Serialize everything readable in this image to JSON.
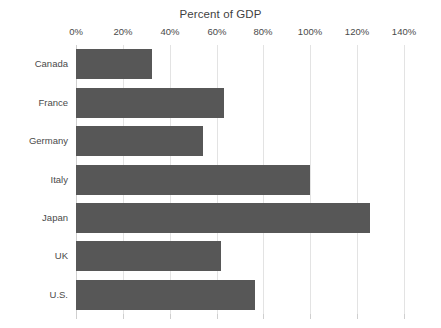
{
  "chart_data": {
    "type": "bar",
    "orientation": "horizontal",
    "title": "Percent of GDP",
    "xlabel": "",
    "ylabel": "",
    "categories": [
      "Canada",
      "France",
      "Germany",
      "Italy",
      "Japan",
      "UK",
      "U.S."
    ],
    "values": [
      32.5,
      63,
      54,
      100,
      125.5,
      62,
      76.5
    ],
    "xlim": [
      0,
      140
    ],
    "ylim": [
      0,
      7
    ],
    "xticks": [
      0,
      20,
      40,
      60,
      80,
      100,
      120,
      140
    ],
    "xtick_labels": [
      "0%",
      "20%",
      "40%",
      "60%",
      "80%",
      "100%",
      "120%",
      "140%"
    ],
    "grid": true,
    "grid_axis": "x",
    "legend": false,
    "legend_position": "none",
    "bar_color": "#575757",
    "grid_color": "#e3e3e3",
    "background_color": "#ffffff",
    "text_color": "#4a4a4a"
  }
}
